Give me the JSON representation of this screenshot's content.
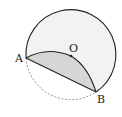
{
  "diagram": {
    "type": "geometry",
    "labels": {
      "A": "A",
      "O": "O",
      "B": "B"
    },
    "colors": {
      "circle_fill": "#f2f2f2",
      "shaded_region": "#d6d6d6",
      "stroke": "#222222",
      "dashed_arc": "#888888"
    }
  }
}
